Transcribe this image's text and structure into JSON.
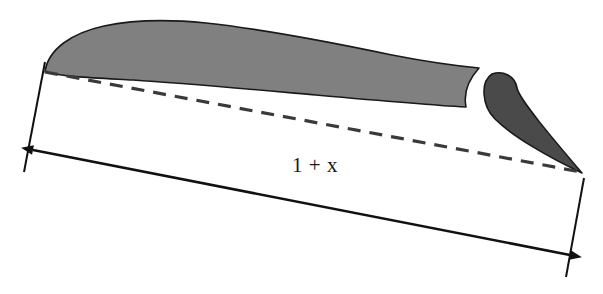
{
  "figure": {
    "type": "technical-line-diagram",
    "background_color": "#ffffff",
    "width": 603,
    "height": 294
  },
  "annotations": {
    "dimension_label": "1 + x",
    "dimension_label_position": {
      "x": 315,
      "y": 172
    },
    "dimension_meaning": "overall extended chord length, unit main chord plus flap extension x"
  },
  "shapes": {
    "main_airfoil": {
      "name": "main-wing-section",
      "fill_color": "#808080",
      "stroke_color": "#1a1a1a",
      "stroke_width": 1.6,
      "leading_edge": {
        "x": 45,
        "y": 72
      },
      "max_thickness_point": {
        "x": 150,
        "y": 21
      },
      "trailing_edge_upper": {
        "x": 479,
        "y": 68
      },
      "trailing_edge_lower": {
        "x": 466,
        "y": 107
      },
      "description": "thick cambered main element, rounded leading edge at left, concave cove cut into the trailing edge at right"
    },
    "flap": {
      "name": "trailing-edge-flap",
      "fill_color": "#4a4a4a",
      "stroke_color": "#1a1a1a",
      "stroke_width": 1.6,
      "nose": {
        "x": 492,
        "y": 74
      },
      "tip": {
        "x": 582,
        "y": 173
      },
      "description": "separate darker deflected flap with rounded nose nesting in the cove and a sharp trailing tip"
    },
    "slot_gap": {
      "name": "slot-gap",
      "fill_color": "#ffffff",
      "description": "white gap between main element cove and flap nose"
    }
  },
  "chord_line": {
    "name": "chord-dashed-line",
    "style": "dashed",
    "color": "#3a3a3a",
    "stroke_width": 3.2,
    "dash_pattern": "13 9",
    "start": {
      "x": 45,
      "y": 72
    },
    "end": {
      "x": 581,
      "y": 172
    }
  },
  "dimension": {
    "name": "overall-length-dimension",
    "color": "#111111",
    "stroke_width": 2.6,
    "arrow_start": {
      "x": 33,
      "y": 150
    },
    "arrow_end": {
      "x": 570,
      "y": 255
    },
    "arrowheads": "both-ends",
    "extension_lines": [
      {
        "name": "left-extension-line",
        "x1": 45,
        "y1": 62,
        "x2": 24,
        "y2": 172
      },
      {
        "name": "right-extension-line",
        "x1": 584,
        "y1": 178,
        "x2": 566,
        "y2": 277
      }
    ]
  },
  "colors": {
    "main_fill": "#808080",
    "flap_fill": "#4a4a4a",
    "outline": "#1a1a1a",
    "dash": "#3a3a3a",
    "dimension": "#111111",
    "background": "#ffffff",
    "text": "#1a1a1a"
  }
}
